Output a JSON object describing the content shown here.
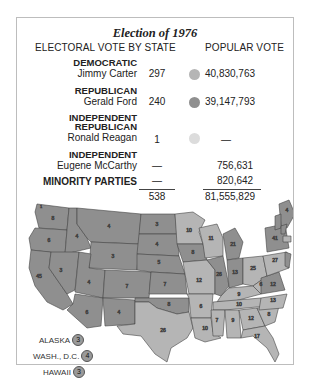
{
  "title": "Election of 1976",
  "headers": {
    "electoral": "ELECTORAL VOTE BY STATE",
    "popular": "POPULAR VOTE"
  },
  "colors": {
    "democratic": "#b5b5b5",
    "republican": "#8f8f8f",
    "independent_republican": "#dcdcdc",
    "border": "#444444"
  },
  "rows": [
    {
      "party": "DEMOCRATIC",
      "candidate": "Jimmy Carter",
      "electoral": "297",
      "popular": "40,830,763",
      "dot": "#b5b5b5"
    },
    {
      "party": "REPUBLICAN",
      "candidate": "Gerald Ford",
      "electoral": "240",
      "popular": "39,147,793",
      "dot": "#8f8f8f"
    },
    {
      "party_line1": "INDEPENDENT",
      "party_line2": "REPUBLICAN",
      "candidate": "Ronald Reagan",
      "electoral": "1",
      "popular": "—",
      "dot": "#dcdcdc"
    },
    {
      "party": "INDEPENDENT",
      "candidate": "Eugene McCarthy",
      "electoral": "—",
      "popular": "756,631"
    },
    {
      "party": "MINORITY PARTIES",
      "electoral": "—",
      "popular": "820,642"
    }
  ],
  "totals": {
    "electoral": "538",
    "popular": "81,555,829"
  },
  "insets": [
    {
      "label": "ALASKA",
      "value": "3"
    },
    {
      "label": "WASH., D.C.",
      "value": "4"
    },
    {
      "label": "HAWAII",
      "value": "3"
    }
  ],
  "map_labels": {
    "WA": "8",
    "WA_r": "1",
    "OR": "6",
    "CA": "45",
    "ID": "4",
    "NV": "3",
    "MT": "4",
    "WY": "3",
    "UT": "4",
    "AZ": "6",
    "CO": "7",
    "NM": "4",
    "ND": "3",
    "SD": "4",
    "NE": "5",
    "KS": "7",
    "OK": "8",
    "TX": "26",
    "MN": "10",
    "IA": "8",
    "MO": "12",
    "AR": "6",
    "LA": "10",
    "WI": "11",
    "IL": "26",
    "MS": "7",
    "MI": "21",
    "IN": "13",
    "KY": "9",
    "TN": "10",
    "AL": "9",
    "OH": "25",
    "GA": "12",
    "FL": "17",
    "SC": "8",
    "NC": "13",
    "VA": "12",
    "WV": "6",
    "PA": "27",
    "NY": "41",
    "ME": "4",
    "VT": "3",
    "NH": "4",
    "MA": "14",
    "RI": "4",
    "CT": "8",
    "NJ": "17",
    "DE": "3",
    "MD": "10"
  }
}
